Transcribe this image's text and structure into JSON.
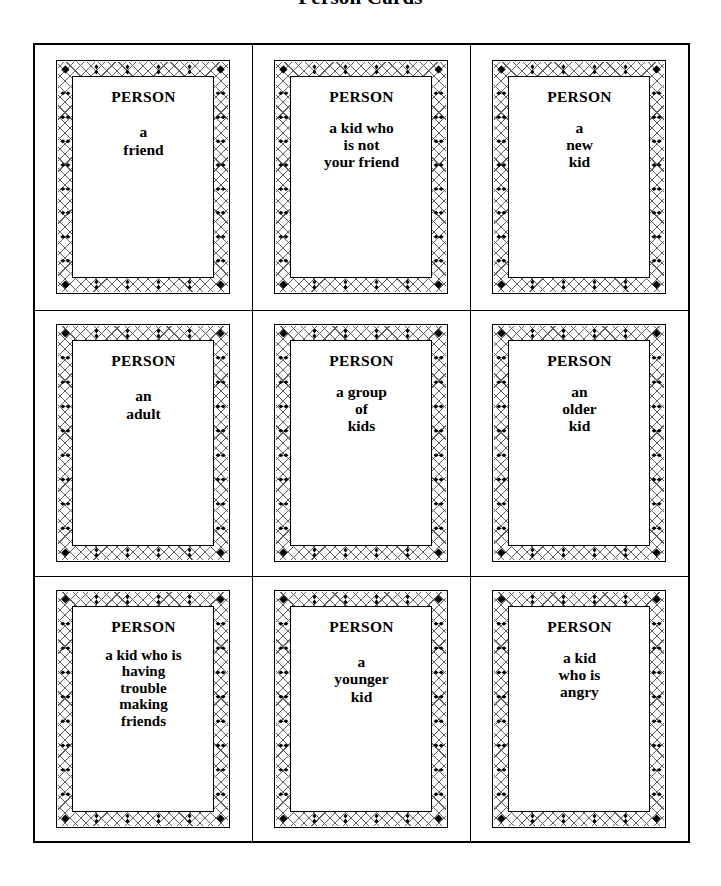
{
  "page": {
    "title": "Person Cards",
    "background_color": "#ffffff",
    "ink_color": "#000000"
  },
  "cards_grid": {
    "rows": 3,
    "columns": 3,
    "card_heading": "PERSON",
    "ornament": {
      "name": "diamond-lattice-border",
      "corner_glyph": "filled-diamond",
      "edge_glyph_horizontal": "vertical-bowtie",
      "edge_glyph_vertical": "horizontal-bowtie"
    },
    "cards": [
      {
        "heading": "PERSON",
        "body": "a\nfriend"
      },
      {
        "heading": "PERSON",
        "body": "a kid who\nis not\nyour friend"
      },
      {
        "heading": "PERSON",
        "body": "a\nnew\nkid"
      },
      {
        "heading": "PERSON",
        "body": "an\nadult"
      },
      {
        "heading": "PERSON",
        "body": "a group\nof\nkids"
      },
      {
        "heading": "PERSON",
        "body": "an\nolder\nkid"
      },
      {
        "heading": "PERSON",
        "body": "a kid who is\nhaving\ntrouble\nmaking\nfriends"
      },
      {
        "heading": "PERSON",
        "body": "a\nyounger\nkid"
      },
      {
        "heading": "PERSON",
        "body": "a kid\nwho is\nangry"
      }
    ]
  }
}
